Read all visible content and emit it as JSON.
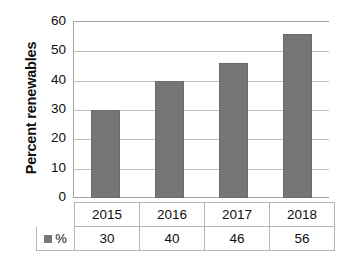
{
  "chart_data": {
    "type": "bar",
    "title": "",
    "xlabel": "",
    "ylabel": "Percent renewables",
    "categories": [
      "2015",
      "2016",
      "2017",
      "2018"
    ],
    "values": [
      30,
      40,
      46,
      56
    ],
    "series": [
      {
        "name": "%",
        "values": [
          30,
          40,
          46,
          56
        ]
      }
    ],
    "ylim": [
      0,
      60
    ],
    "yticks": [
      0,
      10,
      20,
      30,
      40,
      50,
      60
    ],
    "ytick_labels": [
      "0",
      "10",
      "20",
      "30",
      "40",
      "50",
      "60"
    ],
    "grid": true,
    "legend_position": "data-table",
    "bar_color": "#767676",
    "gridline_color": "#bdbdbd",
    "axis_color": "#a6a6a6",
    "background": "#ffffff"
  },
  "data_table": {
    "legend_label": "%",
    "header_row": [
      "2015",
      "2016",
      "2017",
      "2018"
    ],
    "value_row": [
      "30",
      "40",
      "46",
      "56"
    ]
  }
}
